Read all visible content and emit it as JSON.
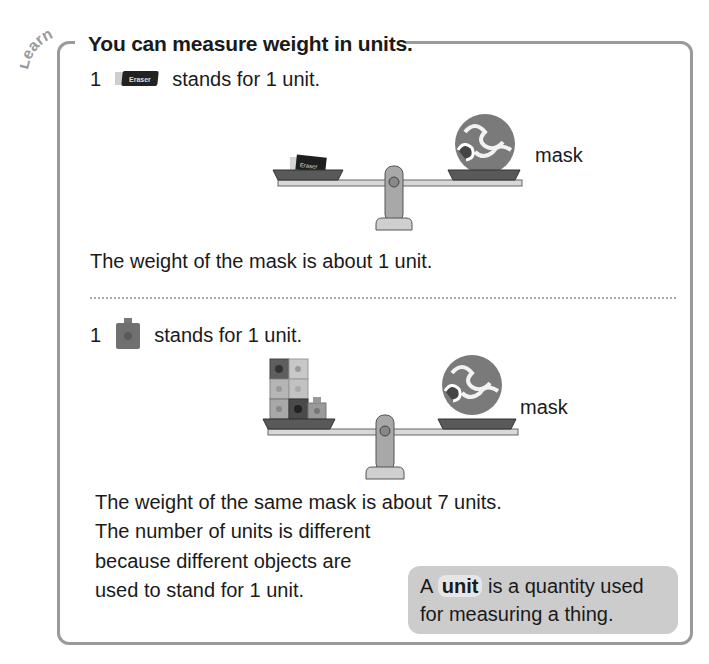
{
  "section_tag": "Learn",
  "title": "You can measure weight in units.",
  "part1": {
    "unit_statement": {
      "count": "1",
      "object": "Eraser",
      "text": "stands for 1 unit."
    },
    "scale": {
      "left_pan": "eraser",
      "right_pan": "mask",
      "right_label": "mask"
    },
    "result": "The weight of the mask is about 1 unit."
  },
  "part2": {
    "unit_statement": {
      "count": "1",
      "object": "cube",
      "text": "stands for 1 unit."
    },
    "scale": {
      "left_pan": "7 cubes",
      "right_pan": "mask",
      "right_label": "mask"
    },
    "result": "The weight of the same mask is about 7 units.",
    "explanation": [
      "The number of units is different",
      "because different objects are",
      "used to stand for 1 unit."
    ]
  },
  "callout": {
    "prefix": "A",
    "keyword": "unit",
    "line1_rest": "is a quantity used",
    "line2": "for measuring a thing."
  },
  "colors": {
    "border": "#9a9a9a",
    "callout_bg": "#cccccc",
    "text": "#1a1a1a"
  }
}
